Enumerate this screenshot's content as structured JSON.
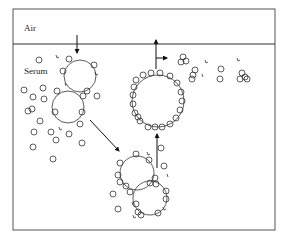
{
  "diagram": {
    "regions": {
      "air_label": "Air",
      "serum_label": "Serum"
    },
    "colors": {
      "line": "#333333",
      "frame": "#555555",
      "background": "#ffffff"
    },
    "frame": {
      "x": 13,
      "y": 9,
      "width": 262,
      "height": 221,
      "interface_y": 44
    },
    "elements": [
      "bubble-entering-from-air",
      "bubble-adsorbing-proteins",
      "fusing-bubble-pair",
      "large-coated-bubble",
      "aggregates-released-at-interface",
      "free-protein-molecules"
    ]
  }
}
